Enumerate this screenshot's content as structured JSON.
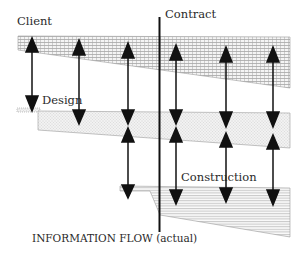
{
  "diagram": {
    "caption": "INFORMATION FLOW (actual)",
    "labels": {
      "client": "Client",
      "design": "Design",
      "contract": "Contract",
      "construction": "Construction"
    },
    "colors": {
      "ink": "#111111",
      "hatch": "#8a8a8a",
      "dots": "#b8b8b8",
      "background": "#ffffff"
    },
    "bands": [
      {
        "name": "client",
        "pattern": "grid-hatch"
      },
      {
        "name": "design",
        "pattern": "dotted"
      },
      {
        "name": "construction",
        "pattern": "horizontal-lines"
      }
    ],
    "arrows": [
      {
        "from": "client",
        "to": "design",
        "count": 6
      },
      {
        "from": "design",
        "to": "construction",
        "count": 4
      }
    ],
    "divider": "contract-line"
  }
}
